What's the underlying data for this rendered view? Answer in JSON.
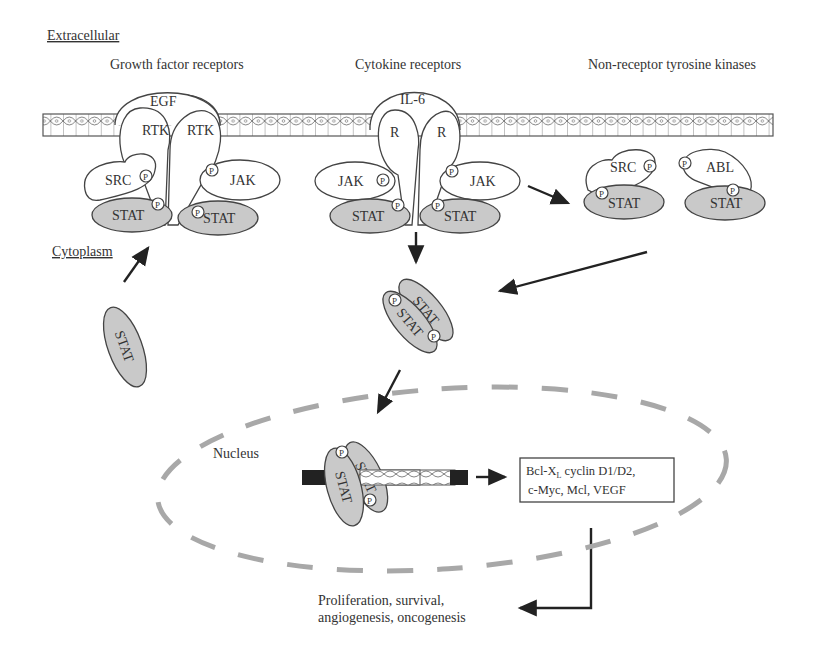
{
  "diagram": {
    "compartments": {
      "extracellular": "Extracellular",
      "cytoplasm": "Cytoplasm",
      "nucleus": "Nucleus"
    },
    "receptor_groups": [
      {
        "label": "Growth factor receptors",
        "ligand": "EGF",
        "receptors": [
          "RTK",
          "RTK"
        ],
        "kinases": [
          "SRC",
          "JAK"
        ]
      },
      {
        "label": "Cytokine receptors",
        "ligand": "IL-6",
        "receptors": [
          "R",
          "R"
        ],
        "kinases": [
          "JAK",
          "JAK"
        ]
      },
      {
        "label": "Non-receptor tyrosine kinases",
        "kinases": [
          "SRC",
          "ABL"
        ]
      }
    ],
    "stat_label": "STAT",
    "phospho_label": "P",
    "target_genes": {
      "line1": "Bcl-X",
      "line1_sub": "L",
      "line1_rest": " cyclin D1/D2,",
      "line2": "c-Myc, Mcl, VEGF"
    },
    "outcomes": {
      "line1": "Proliferation, survival,",
      "line2": "angiogenesis, oncogenesis"
    },
    "colors": {
      "stat_fill": "#c9c9c9",
      "nucleus_dash": "#a8a8a8",
      "line": "#444444"
    }
  }
}
